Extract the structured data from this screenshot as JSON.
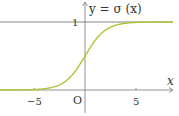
{
  "chart_data": {
    "type": "line",
    "xlabel": "x",
    "ylabel": "y",
    "origin_label": "O",
    "x_ticks": [
      -5,
      5
    ],
    "x_tick_labels": [
      "−5",
      "5"
    ],
    "y_ticks": [
      1
    ],
    "y_tick_labels": [
      "1"
    ],
    "xlim": [
      -8.3,
      8.5
    ],
    "ylim": [
      0,
      1.3
    ],
    "grid": false,
    "legend": "none",
    "asymptote": {
      "y": 1,
      "color": "#555555"
    },
    "series": [
      {
        "name": "σ(x) = 1/(1+e^(−x))",
        "color": "#a8c838",
        "x": [
          -8,
          -6,
          -5,
          -4,
          -3,
          -2,
          -1,
          0,
          1,
          2,
          3,
          4,
          5,
          6,
          8
        ],
        "values": [
          0.0003,
          0.0025,
          0.0067,
          0.018,
          0.047,
          0.119,
          0.269,
          0.5,
          0.731,
          0.881,
          0.953,
          0.982,
          0.993,
          0.9975,
          0.9997
        ]
      }
    ]
  },
  "labels": {
    "curve_label": "y = σ (x)",
    "x_axis": "x",
    "origin": "O",
    "tick_neg5": "−5",
    "tick_5": "5",
    "tick_1": "1"
  }
}
